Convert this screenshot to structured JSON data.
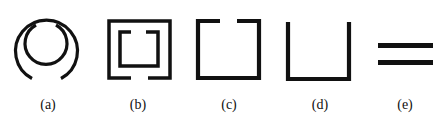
{
  "figure": {
    "stroke_color": "#111111",
    "background": "#ffffff",
    "panels": [
      {
        "id": "a",
        "label": "(a)",
        "shape": "concentric-split-rings",
        "description": "Two concentric circular rings; outer ring gap at bottom, inner ring gap at top"
      },
      {
        "id": "b",
        "label": "(b)",
        "shape": "concentric-split-squares",
        "description": "Two concentric square rings; outer gap at bottom, inner gap at top"
      },
      {
        "id": "c",
        "label": "(c)",
        "shape": "split-square",
        "description": "Single square ring with gap at top"
      },
      {
        "id": "d",
        "label": "(d)",
        "shape": "u-shape",
        "description": "Open-top U shape"
      },
      {
        "id": "e",
        "label": "(e)",
        "shape": "parallel-bars",
        "description": "Two parallel horizontal bars"
      }
    ]
  }
}
